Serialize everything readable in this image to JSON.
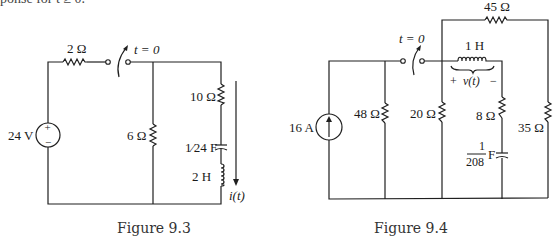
{
  "top_fragment": "ponse for t ≥ 0.",
  "figure_9_3": {
    "caption": "Figure 9.3",
    "source_label": "24 V",
    "source_plus": "+",
    "source_minus": "−",
    "series_resistor": "2 Ω",
    "switch_label": "t = 0",
    "shunt_resistor": "6 Ω",
    "branch_resistor": "10 Ω",
    "capacitor_label": "1⁄24 F",
    "inductor_label": "2 H",
    "current_label": "i(t)"
  },
  "figure_9_4": {
    "caption": "Figure 9.4",
    "source_label": "16 A",
    "switch_label": "t = 0",
    "r48": "48 Ω",
    "r20": "20 Ω",
    "r45": "45 Ω",
    "inductor_label": "1 H",
    "voltage_plus": "+",
    "voltage_label": "v(t)",
    "voltage_minus": "−",
    "r8": "8 Ω",
    "cap_num": "1",
    "cap_den": "208",
    "cap_unit": "F",
    "r35": "35 Ω"
  }
}
